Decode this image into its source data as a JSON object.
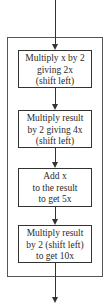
{
  "diagram": {
    "type": "flowchart",
    "steps": [
      {
        "lines": [
          "Multiply x by 2",
          "giving 2x",
          "(shift left)"
        ]
      },
      {
        "lines": [
          "Multiply result",
          "by 2 giving 4x",
          "(shift left)"
        ]
      },
      {
        "lines": [
          "Add x",
          "to the result",
          "to get 5x"
        ]
      },
      {
        "lines": [
          "Multiply result",
          "by 2 (shift left)",
          "to get 10x"
        ]
      }
    ],
    "colors": {
      "line": "#333333",
      "background": "#ffffff"
    }
  }
}
